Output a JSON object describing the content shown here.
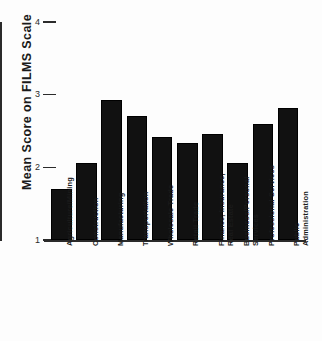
{
  "chart_data": {
    "type": "bar",
    "title": "",
    "xlabel": "",
    "ylabel": "Mean Score on FILMS Scale",
    "ylim": [
      1,
      4
    ],
    "yticks": [
      1,
      2,
      3,
      4
    ],
    "ytick_labels": [
      "1",
      "2",
      "3",
      "4"
    ],
    "grid": false,
    "legend": null,
    "categories": [
      "Agriculture/Mining",
      "Construction",
      "Manufacturing",
      "Transportation",
      "Wholesale Trade",
      "Retail Trade",
      "Finance, Insurance,\nReal Estate",
      "Business/Personal\nServices",
      "Professional Services",
      "Public\nAdministration"
    ],
    "values": [
      1.7,
      2.06,
      2.93,
      2.7,
      2.42,
      2.34,
      2.46,
      2.06,
      2.59,
      2.81
    ],
    "bar_color": "#111111",
    "axis_color": "#2b2b2b",
    "background_color": "#fdfdfd"
  },
  "axis": {
    "y_label": "Mean Score on FILMS Scale"
  }
}
